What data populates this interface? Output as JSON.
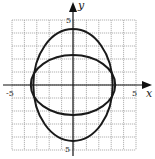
{
  "chart_data": {
    "type": "line",
    "title": "",
    "xlabel": "x",
    "ylabel": "y",
    "xlim": [
      -5,
      5
    ],
    "ylim": [
      -5,
      5
    ],
    "grid": true,
    "grid_step": 1,
    "tick_labels": {
      "x": [
        "-5",
        "5"
      ],
      "y": [
        "5",
        "-5"
      ]
    },
    "series": [
      {
        "name": "tall-ellipse",
        "shape": "ellipse",
        "center": [
          0,
          0
        ],
        "semi_axis_x": 3.2,
        "semi_axis_y": 4.3
      },
      {
        "name": "wide-ellipse",
        "shape": "ellipse",
        "center": [
          0,
          0
        ],
        "semi_axis_x": 3.4,
        "semi_axis_y": 2.3
      }
    ],
    "legend": null
  },
  "axes": {
    "x_label": "x",
    "y_label": "y",
    "x_tick_neg": "-5",
    "x_tick_pos": "5",
    "y_tick_pos": "5",
    "y_tick_neg": "5"
  },
  "colors": {
    "curve": "#1a1a1a",
    "axis": "#111111",
    "grid": "#9a9a9a"
  }
}
